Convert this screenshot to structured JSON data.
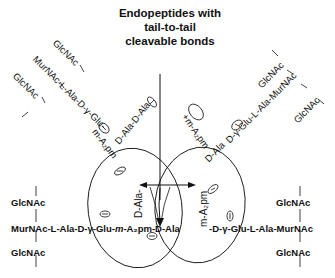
{
  "title": {
    "line1": "Endopeptides with",
    "line2": "tail-to-tail",
    "line3": "cleavable bonds"
  },
  "upper_left_strand": {
    "glcnac_top": "GlcNAc",
    "murnac_chain": "MurNAc-L-Ala-D-γ-Glu-m-A₂pm-D-Ala-D-Ala",
    "murnac_part": "MurNAc-L-Ala-D-γ-Glu-",
    "dap_part": "m-A₂pm",
    "side_chain": "D-Ala-D-Ala",
    "glcnac_bottom": "GlcNAc"
  },
  "upper_right_strand": {
    "glcnac_top": "GlcNAc",
    "chain": "m-A₂pm-D-γ-Glu-L-Ala-MurNAc",
    "dap_part": "+m-A₂pm",
    "d_ala": "D-Ala",
    "glu_part": "D-γ-Glu-L-Ala-MurNAc",
    "glcnac_bottom": "GlcNAc"
  },
  "lower_left_strand": {
    "glcnac_top": "GlcNAc",
    "chain_prefix": "MurNAc-L-Ala-D-γ-Glu-",
    "chain_dap": "m",
    "chain_suffix": "-A₂pm-D-Ala",
    "cross_link": "D-Ala-",
    "glcnac_bottom": "GlcNAc"
  },
  "lower_right_strand": {
    "glcnac_top": "GlcNAc",
    "vertical_dap": "m-A₂pm",
    "chain": "-D-γ-Glu-L-Ala-MurNAc",
    "glcnac_bottom": "GlcNAc"
  },
  "charges": {
    "minus": "−",
    "plus": "+"
  },
  "colors": {
    "ink": "#111111",
    "background": "#ffffff"
  }
}
